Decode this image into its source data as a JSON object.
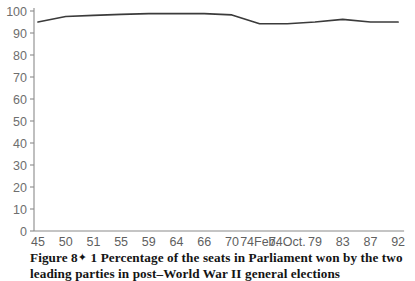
{
  "figure": {
    "caption_line_1_prefix": "Figure 8",
    "caption_ornament": "✦",
    "caption_line_1": "1 Percentage of the seats in Parliament won by the two",
    "caption_line_2": "leading parties in post–World War II general elections"
  },
  "colors": {
    "line": "#3b3b3b",
    "axis": "#8a8a8a",
    "tick_label": "#5f5f5f",
    "background": "#ffffff",
    "caption_text": "#141414"
  },
  "chart_data": {
    "type": "line",
    "title": "",
    "xlabel": "",
    "ylabel": "",
    "ylim": [
      0,
      100
    ],
    "ytick_values": [
      0,
      10,
      20,
      30,
      40,
      50,
      60,
      70,
      80,
      90,
      100
    ],
    "ytick_labels": [
      "0",
      "10",
      "20",
      "30",
      "40",
      "50",
      "60",
      "70",
      "80",
      "90",
      "100"
    ],
    "grid": false,
    "legend": false,
    "categories": [
      "45",
      "50",
      "51",
      "55",
      "59",
      "64",
      "66",
      "70",
      "74Feb.",
      "74Oct.",
      "79",
      "83",
      "87",
      "92"
    ],
    "series": [
      {
        "name": "Two leading parties share of seats",
        "values": [
          95,
          97.5,
          98,
          98.5,
          98.8,
          98.8,
          98.8,
          98.2,
          94.2,
          94.2,
          95,
          96.2,
          95,
          95
        ]
      }
    ]
  }
}
